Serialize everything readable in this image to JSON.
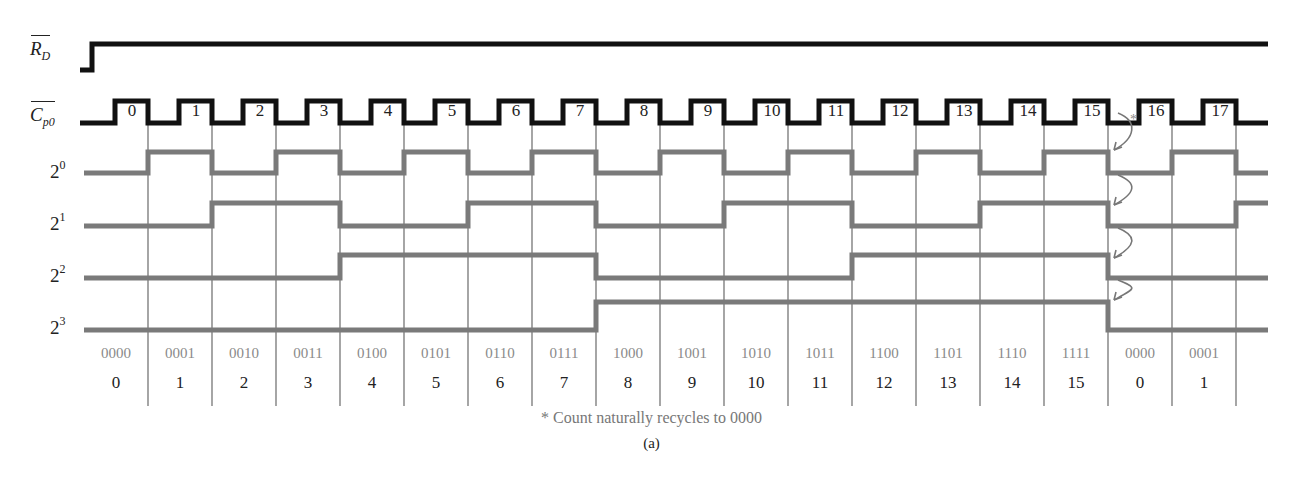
{
  "signals": {
    "reset": {
      "label_main": "R",
      "label_sub": "D",
      "overbar": true
    },
    "clock": {
      "label_main": "C",
      "label_sub": "p0",
      "overbar": true
    },
    "q0": {
      "base": "2",
      "exp": "0"
    },
    "q1": {
      "base": "2",
      "exp": "1"
    },
    "q2": {
      "base": "2",
      "exp": "2"
    },
    "q3": {
      "base": "2",
      "exp": "3"
    }
  },
  "clock_pulses": [
    "0",
    "1",
    "2",
    "3",
    "4",
    "5",
    "6",
    "7",
    "8",
    "9",
    "10",
    "11",
    "12",
    "13",
    "14",
    "15",
    "16",
    "17"
  ],
  "states": [
    {
      "binary": "0000",
      "decimal": "0"
    },
    {
      "binary": "0001",
      "decimal": "1"
    },
    {
      "binary": "0010",
      "decimal": "2"
    },
    {
      "binary": "0011",
      "decimal": "3"
    },
    {
      "binary": "0100",
      "decimal": "4"
    },
    {
      "binary": "0101",
      "decimal": "5"
    },
    {
      "binary": "0110",
      "decimal": "6"
    },
    {
      "binary": "0111",
      "decimal": "7"
    },
    {
      "binary": "1000",
      "decimal": "8"
    },
    {
      "binary": "1001",
      "decimal": "9"
    },
    {
      "binary": "1010",
      "decimal": "10"
    },
    {
      "binary": "1011",
      "decimal": "11"
    },
    {
      "binary": "1100",
      "decimal": "12"
    },
    {
      "binary": "1101",
      "decimal": "13"
    },
    {
      "binary": "1110",
      "decimal": "14"
    },
    {
      "binary": "1111",
      "decimal": "15"
    },
    {
      "binary": "0000",
      "decimal": "0"
    },
    {
      "binary": "0001",
      "decimal": "1"
    }
  ],
  "annotation_marker": "*",
  "footnote": "* Count naturally recycles to 0000",
  "caption": "(a)",
  "colors": {
    "control_signal": "#111111",
    "output_signal": "#7a7a7a",
    "grid_line": "#6a6a6a",
    "binary_text": "#8a8a8a"
  }
}
